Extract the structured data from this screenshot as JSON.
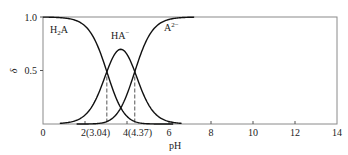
{
  "chart_data": {
    "type": "line",
    "title": "",
    "xlabel": "pH",
    "ylabel": "δ",
    "xlim": [
      0,
      14
    ],
    "ylim": [
      0,
      1.0
    ],
    "grid": false,
    "legend_position": "inline labels",
    "x_ticks": [
      0,
      2,
      4,
      6,
      8,
      10,
      12,
      14
    ],
    "x_tick_labels": [
      "0",
      "2(3.04)",
      "4(4.37)",
      "6",
      "8",
      "10",
      "12",
      "14"
    ],
    "y_ticks": [
      0.5,
      1.0
    ],
    "y_tick_labels": [
      "0.5",
      "1.0"
    ],
    "pKa": [
      3.04,
      4.37
    ],
    "series": [
      {
        "name": "H2A",
        "label_main": "H",
        "label_sub": "2",
        "label_tail": "A",
        "x": [
          0,
          1,
          2,
          2.5,
          3,
          3.04,
          3.5,
          4,
          4.5,
          5,
          6,
          7
        ],
        "values": [
          1.0,
          0.99,
          0.92,
          0.78,
          0.52,
          0.49,
          0.25,
          0.09,
          0.02,
          0.01,
          0.0,
          0.0
        ]
      },
      {
        "name": "HA⁻",
        "label_main": "HA",
        "label_sup": "−",
        "x": [
          1,
          2,
          2.5,
          3,
          3.5,
          3.7,
          4,
          4.37,
          4.5,
          5,
          6,
          7
        ],
        "values": [
          0.01,
          0.08,
          0.22,
          0.47,
          0.69,
          0.73,
          0.66,
          0.5,
          0.42,
          0.19,
          0.02,
          0.0
        ]
      },
      {
        "name": "A²⁻",
        "label_main": "A",
        "label_sup": "2−",
        "x": [
          2,
          3,
          3.5,
          4,
          4.37,
          4.5,
          5,
          5.5,
          6,
          6.5,
          7
        ],
        "values": [
          0.0,
          0.01,
          0.06,
          0.25,
          0.49,
          0.56,
          0.8,
          0.93,
          0.98,
          1.0,
          1.0
        ]
      }
    ],
    "annotations": [
      {
        "type": "dashed-vline",
        "x": 3.04,
        "y_top": 0.5
      },
      {
        "type": "dashed-vline",
        "x": 4.37,
        "y_top": 0.5
      }
    ]
  },
  "colors": {
    "frame": "#8a8a8a",
    "curve": "#111111",
    "dashed": "#555555",
    "text": "#222222"
  }
}
